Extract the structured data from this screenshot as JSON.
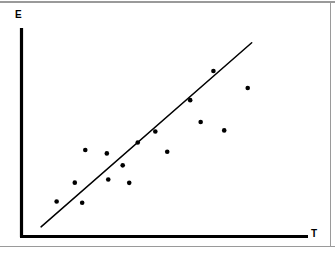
{
  "figure": {
    "y_axis_label": "E",
    "x_axis_label": "T",
    "axis_color": "#000000",
    "point_color": "#000000",
    "line_color": "#000000",
    "background_color": "#ffffff",
    "frame_color": "#9a9a9a"
  },
  "chart_data": {
    "type": "scatter",
    "title": "",
    "subtitle": "",
    "xlabel": "T",
    "ylabel": "E",
    "grid": false,
    "legend": null,
    "axis_style": "two-axis L-shaped, no ticks, no tick labels",
    "xlim": [
      0,
      100
    ],
    "ylim": [
      0,
      100
    ],
    "points": [
      {
        "x": 12.4,
        "y": 17.8
      },
      {
        "x": 18.8,
        "y": 27.4
      },
      {
        "x": 21.4,
        "y": 17.2
      },
      {
        "x": 22.5,
        "y": 44.0
      },
      {
        "x": 30.1,
        "y": 42.3
      },
      {
        "x": 30.6,
        "y": 29.0
      },
      {
        "x": 35.7,
        "y": 36.2
      },
      {
        "x": 38.0,
        "y": 27.3
      },
      {
        "x": 41.0,
        "y": 47.8
      },
      {
        "x": 47.2,
        "y": 53.4
      },
      {
        "x": 51.4,
        "y": 43.1
      },
      {
        "x": 59.5,
        "y": 69.4
      },
      {
        "x": 63.2,
        "y": 58.3
      },
      {
        "x": 67.7,
        "y": 84.2
      },
      {
        "x": 71.5,
        "y": 54.0
      },
      {
        "x": 79.8,
        "y": 75.6
      }
    ],
    "fit_line": {
      "kind": "linear trend line",
      "x_start": 6.9,
      "y_start": 4.9,
      "x_end": 81.2,
      "y_end": 98.6
    },
    "n_points": 16,
    "annotations": []
  }
}
